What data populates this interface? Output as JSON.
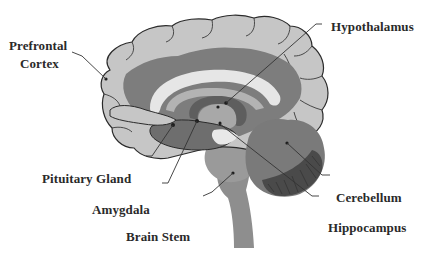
{
  "diagram": {
    "type": "anatomical-diagram",
    "colors": {
      "cortex": "#c6c6c6",
      "inner_cortex": "#7d7d7d",
      "corpus_callosum": "#e6e6e6",
      "fornix": "#5e5e5e",
      "thalamus": "#a8a8a8",
      "brainstem": "#8e8e8e",
      "cerebellum": "#7a7a7a",
      "cerebellum_dark": "#4a4a4a",
      "outline": "#2b2b2b",
      "leader_line": "#333333",
      "label_text": "#2a2a2a"
    },
    "labels": [
      {
        "id": "prefrontal-cortex",
        "text_line1": "Prefrontal",
        "text_line2": "Cortex"
      },
      {
        "id": "hypothalamus",
        "text": "Hypothalamus"
      },
      {
        "id": "pituitary-gland",
        "text": "Pituitary Gland"
      },
      {
        "id": "amygdala",
        "text": "Amygdala"
      },
      {
        "id": "brain-stem",
        "text": "Brain Stem"
      },
      {
        "id": "cerebellum",
        "text": "Cerebellum"
      },
      {
        "id": "hippocampus",
        "text": "Hippocampus"
      }
    ]
  }
}
